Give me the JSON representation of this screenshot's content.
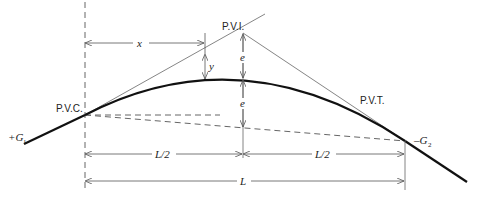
{
  "figure": {
    "points": {
      "pvc": "P.V.C.",
      "pvi": "P.V.I.",
      "pvt": "P.V.T."
    },
    "grades": {
      "g1_sign": "+",
      "g1": "G",
      "g1_sub": "1",
      "g2_sign": "–",
      "g2": "G",
      "g2_sub": "2"
    },
    "dimensions": {
      "x": "x",
      "y": "y",
      "e_upper": "e",
      "e_lower": "e",
      "half_left": "L/2",
      "half_right": "L/2",
      "total": "L"
    },
    "colors": {
      "curve": "#111111",
      "lines": "#555555",
      "dashed": "#666666"
    }
  }
}
